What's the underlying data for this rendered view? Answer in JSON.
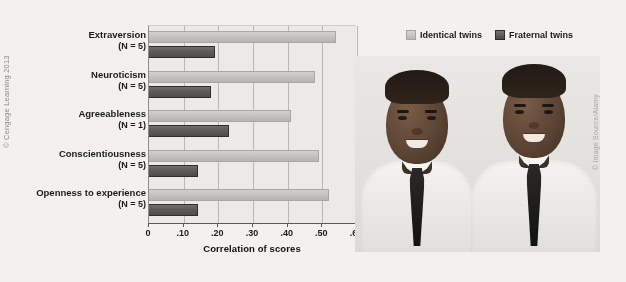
{
  "figure": {
    "left_credit": "© Cengage Learning 2013",
    "right_credit": "© Image Source/Alamy",
    "photo_alt": "photograph-of-identical-twin-brothers-in-white-shirts-and-dark-ties"
  },
  "legend": {
    "position": "top-right",
    "items": [
      {
        "label": "Identical twins",
        "color": "#c4c2be",
        "swatch": "identical"
      },
      {
        "label": "Fraternal twins",
        "color": "#585755",
        "swatch": "fraternal"
      }
    ]
  },
  "chart_data": {
    "type": "bar",
    "orientation": "horizontal",
    "title": "",
    "xlabel": "Correlation of scores",
    "ylabel": "",
    "xlim": [
      0,
      0.6
    ],
    "xticks": [
      0,
      0.1,
      0.2,
      0.3,
      0.4,
      0.5,
      0.6
    ],
    "xticklabels": [
      "0",
      ".10",
      ".20",
      ".30",
      ".40",
      ".50",
      ".60"
    ],
    "grid": "vertical",
    "legend_position": "top-right",
    "categories": [
      "Extraversion",
      "Neuroticism",
      "Agreeableness",
      "Conscientiousness",
      "Openness to experience"
    ],
    "category_sublabels": [
      "(N = 5)",
      "(N = 5)",
      "(N = 1)",
      "(N = 5)",
      "(N = 5)"
    ],
    "series": [
      {
        "name": "Identical twins",
        "color": "#c4c2be",
        "values": [
          0.54,
          0.48,
          0.41,
          0.49,
          0.52
        ]
      },
      {
        "name": "Fraternal twins",
        "color": "#585755",
        "values": [
          0.19,
          0.18,
          0.23,
          0.14,
          0.14
        ]
      }
    ]
  }
}
